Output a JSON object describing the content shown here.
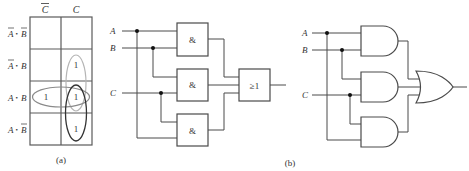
{
  "kmap": {
    "column_headers": [
      "C̄",
      "C"
    ],
    "column_header_parts": [
      {
        "letter": "C",
        "bar": true
      },
      {
        "letter": "C",
        "bar": false
      }
    ],
    "row_labels": [
      {
        "a": "A",
        "a_bar": true,
        "b": "B",
        "b_bar": true
      },
      {
        "a": "A",
        "a_bar": true,
        "b": "B",
        "b_bar": false
      },
      {
        "a": "A",
        "a_bar": false,
        "b": "B",
        "b_bar": false
      },
      {
        "a": "A",
        "a_bar": false,
        "b": "B",
        "b_bar": true
      }
    ],
    "dot": "•",
    "cells": [
      [
        "",
        ""
      ],
      [
        "",
        "1"
      ],
      [
        "1",
        "1"
      ],
      [
        "",
        "1"
      ]
    ],
    "groups": [
      {
        "name": "B·C",
        "color": "#b0b0b0"
      },
      {
        "name": "A·B",
        "color": "#8a8a8a"
      },
      {
        "name": "A·C",
        "color": "#333333"
      }
    ],
    "caption": "(a)"
  },
  "circuit_iec": {
    "inputs": [
      "A",
      "B",
      "C"
    ],
    "and_symbol": "&",
    "or_symbol": "≥1",
    "and_gate_count": 3
  },
  "circuit_ansi": {
    "inputs": [
      "A",
      "B",
      "C"
    ],
    "and_gate_count": 3
  },
  "caption_b": "(b)"
}
